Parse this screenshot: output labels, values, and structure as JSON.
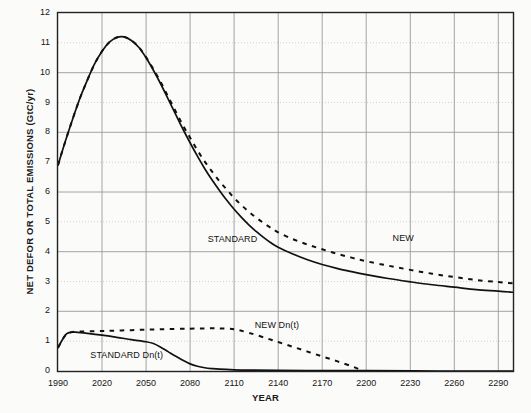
{
  "chart_data": {
    "type": "line",
    "title": "",
    "xlabel": "YEAR",
    "ylabel": "NET DEFOR OR TOTAL EMISSIONS (GtC/yr)",
    "xlim": [
      1990,
      2300
    ],
    "ylim": [
      0,
      12
    ],
    "xticks": [
      1990,
      2020,
      2050,
      2080,
      2110,
      2140,
      2170,
      2200,
      2230,
      2260,
      2290
    ],
    "yticks": [
      0,
      1,
      2,
      3,
      4,
      5,
      6,
      7,
      8,
      9,
      10,
      11,
      12
    ],
    "grid": "on",
    "legend_position": "inline-annotations",
    "series": [
      {
        "name": "STANDARD",
        "style": "solid",
        "color": "#111111",
        "annotation": "STANDARD",
        "points": [
          [
            1990,
            6.9
          ],
          [
            1995,
            7.7
          ],
          [
            2000,
            8.45
          ],
          [
            2005,
            9.15
          ],
          [
            2010,
            9.75
          ],
          [
            2015,
            10.3
          ],
          [
            2020,
            10.72
          ],
          [
            2025,
            11.02
          ],
          [
            2030,
            11.18
          ],
          [
            2035,
            11.2
          ],
          [
            2040,
            11.08
          ],
          [
            2045,
            10.85
          ],
          [
            2050,
            10.5
          ],
          [
            2055,
            10.08
          ],
          [
            2060,
            9.62
          ],
          [
            2065,
            9.12
          ],
          [
            2070,
            8.62
          ],
          [
            2075,
            8.12
          ],
          [
            2080,
            7.65
          ],
          [
            2085,
            7.2
          ],
          [
            2090,
            6.78
          ],
          [
            2095,
            6.4
          ],
          [
            2100,
            6.05
          ],
          [
            2105,
            5.72
          ],
          [
            2110,
            5.42
          ],
          [
            2115,
            5.15
          ],
          [
            2120,
            4.9
          ],
          [
            2125,
            4.68
          ],
          [
            2130,
            4.48
          ],
          [
            2135,
            4.3
          ],
          [
            2140,
            4.15
          ],
          [
            2150,
            3.92
          ],
          [
            2160,
            3.73
          ],
          [
            2170,
            3.57
          ],
          [
            2180,
            3.44
          ],
          [
            2190,
            3.33
          ],
          [
            2200,
            3.23
          ],
          [
            2215,
            3.1
          ],
          [
            2230,
            2.99
          ],
          [
            2245,
            2.89
          ],
          [
            2260,
            2.81
          ],
          [
            2275,
            2.73
          ],
          [
            2290,
            2.68
          ],
          [
            2300,
            2.64
          ]
        ]
      },
      {
        "name": "NEW",
        "style": "dashed",
        "color": "#111111",
        "annotation": "NEW",
        "points": [
          [
            1990,
            6.9
          ],
          [
            1995,
            7.7
          ],
          [
            2000,
            8.45
          ],
          [
            2005,
            9.15
          ],
          [
            2010,
            9.75
          ],
          [
            2015,
            10.3
          ],
          [
            2020,
            10.72
          ],
          [
            2025,
            11.02
          ],
          [
            2030,
            11.18
          ],
          [
            2035,
            11.2
          ],
          [
            2040,
            11.08
          ],
          [
            2045,
            10.86
          ],
          [
            2050,
            10.52
          ],
          [
            2055,
            10.12
          ],
          [
            2060,
            9.68
          ],
          [
            2065,
            9.2
          ],
          [
            2070,
            8.72
          ],
          [
            2075,
            8.25
          ],
          [
            2080,
            7.82
          ],
          [
            2085,
            7.4
          ],
          [
            2090,
            7.02
          ],
          [
            2095,
            6.68
          ],
          [
            2100,
            6.36
          ],
          [
            2105,
            6.08
          ],
          [
            2110,
            5.8
          ],
          [
            2115,
            5.56
          ],
          [
            2120,
            5.34
          ],
          [
            2125,
            5.14
          ],
          [
            2130,
            4.96
          ],
          [
            2135,
            4.8
          ],
          [
            2140,
            4.65
          ],
          [
            2150,
            4.42
          ],
          [
            2160,
            4.24
          ],
          [
            2170,
            4.08
          ],
          [
            2180,
            3.93
          ],
          [
            2190,
            3.8
          ],
          [
            2200,
            3.68
          ],
          [
            2215,
            3.53
          ],
          [
            2230,
            3.39
          ],
          [
            2245,
            3.26
          ],
          [
            2260,
            3.15
          ],
          [
            2275,
            3.05
          ],
          [
            2290,
            2.98
          ],
          [
            2300,
            2.94
          ]
        ]
      },
      {
        "name": "STANDARD Dn(t)",
        "style": "solid",
        "color": "#111111",
        "annotation": "STANDARD Dn(t)",
        "points": [
          [
            1990,
            0.78
          ],
          [
            1993,
            1.05
          ],
          [
            1996,
            1.25
          ],
          [
            1999,
            1.3
          ],
          [
            2002,
            1.3
          ],
          [
            2010,
            1.26
          ],
          [
            2020,
            1.2
          ],
          [
            2030,
            1.13
          ],
          [
            2040,
            1.05
          ],
          [
            2050,
            0.98
          ],
          [
            2055,
            0.92
          ],
          [
            2060,
            0.8
          ],
          [
            2065,
            0.65
          ],
          [
            2070,
            0.5
          ],
          [
            2075,
            0.36
          ],
          [
            2080,
            0.24
          ],
          [
            2085,
            0.16
          ],
          [
            2090,
            0.11
          ],
          [
            2095,
            0.08
          ],
          [
            2100,
            0.06
          ],
          [
            2110,
            0.04
          ],
          [
            2120,
            0.03
          ],
          [
            2140,
            0.02
          ],
          [
            2170,
            0.01
          ],
          [
            2200,
            0.01
          ],
          [
            2250,
            0.0
          ],
          [
            2300,
            0.0
          ]
        ]
      },
      {
        "name": "NEW Dn(t)",
        "style": "dashed",
        "color": "#111111",
        "annotation": "NEW Dn(t)",
        "points": [
          [
            1990,
            0.78
          ],
          [
            1993,
            1.05
          ],
          [
            1996,
            1.25
          ],
          [
            1999,
            1.3
          ],
          [
            2002,
            1.32
          ],
          [
            2020,
            1.34
          ],
          [
            2040,
            1.37
          ],
          [
            2060,
            1.4
          ],
          [
            2080,
            1.42
          ],
          [
            2095,
            1.43
          ],
          [
            2105,
            1.42
          ],
          [
            2112,
            1.38
          ],
          [
            2120,
            1.28
          ],
          [
            2130,
            1.13
          ],
          [
            2140,
            0.97
          ],
          [
            2150,
            0.81
          ],
          [
            2160,
            0.65
          ],
          [
            2170,
            0.49
          ],
          [
            2180,
            0.33
          ],
          [
            2190,
            0.16
          ],
          [
            2196,
            0.04
          ],
          [
            2198,
            0.0
          ]
        ]
      }
    ],
    "annotations": [
      {
        "text": "STANDARD",
        "x": 2092,
        "y": 4.38
      },
      {
        "text": "NEW",
        "x": 2218,
        "y": 4.42
      },
      {
        "text": "NEW Dn(t)",
        "x": 2124,
        "y": 1.52
      },
      {
        "text": "STANDARD Dn(t)",
        "x": 2012,
        "y": 0.52
      }
    ]
  },
  "axes": {
    "y_title": "NET DEFOR OR TOTAL EMISSIONS (GtC/yr)",
    "x_title": "YEAR",
    "y_tick_labels": [
      "12",
      "11",
      "10",
      "9",
      "8",
      "7",
      "6",
      "5",
      "4",
      "3",
      "2",
      "1",
      "0"
    ],
    "x_tick_labels": [
      "1990",
      "2020",
      "2050",
      "2080",
      "2110",
      "2140",
      "2170",
      "2200",
      "2230",
      "2260",
      "2290"
    ]
  },
  "colors": {
    "ink": "#111111",
    "grid_major": "#9a9a9a",
    "grid_minor": "#c4c4c4",
    "frame": "#222222",
    "background": "#fbfbfa"
  }
}
